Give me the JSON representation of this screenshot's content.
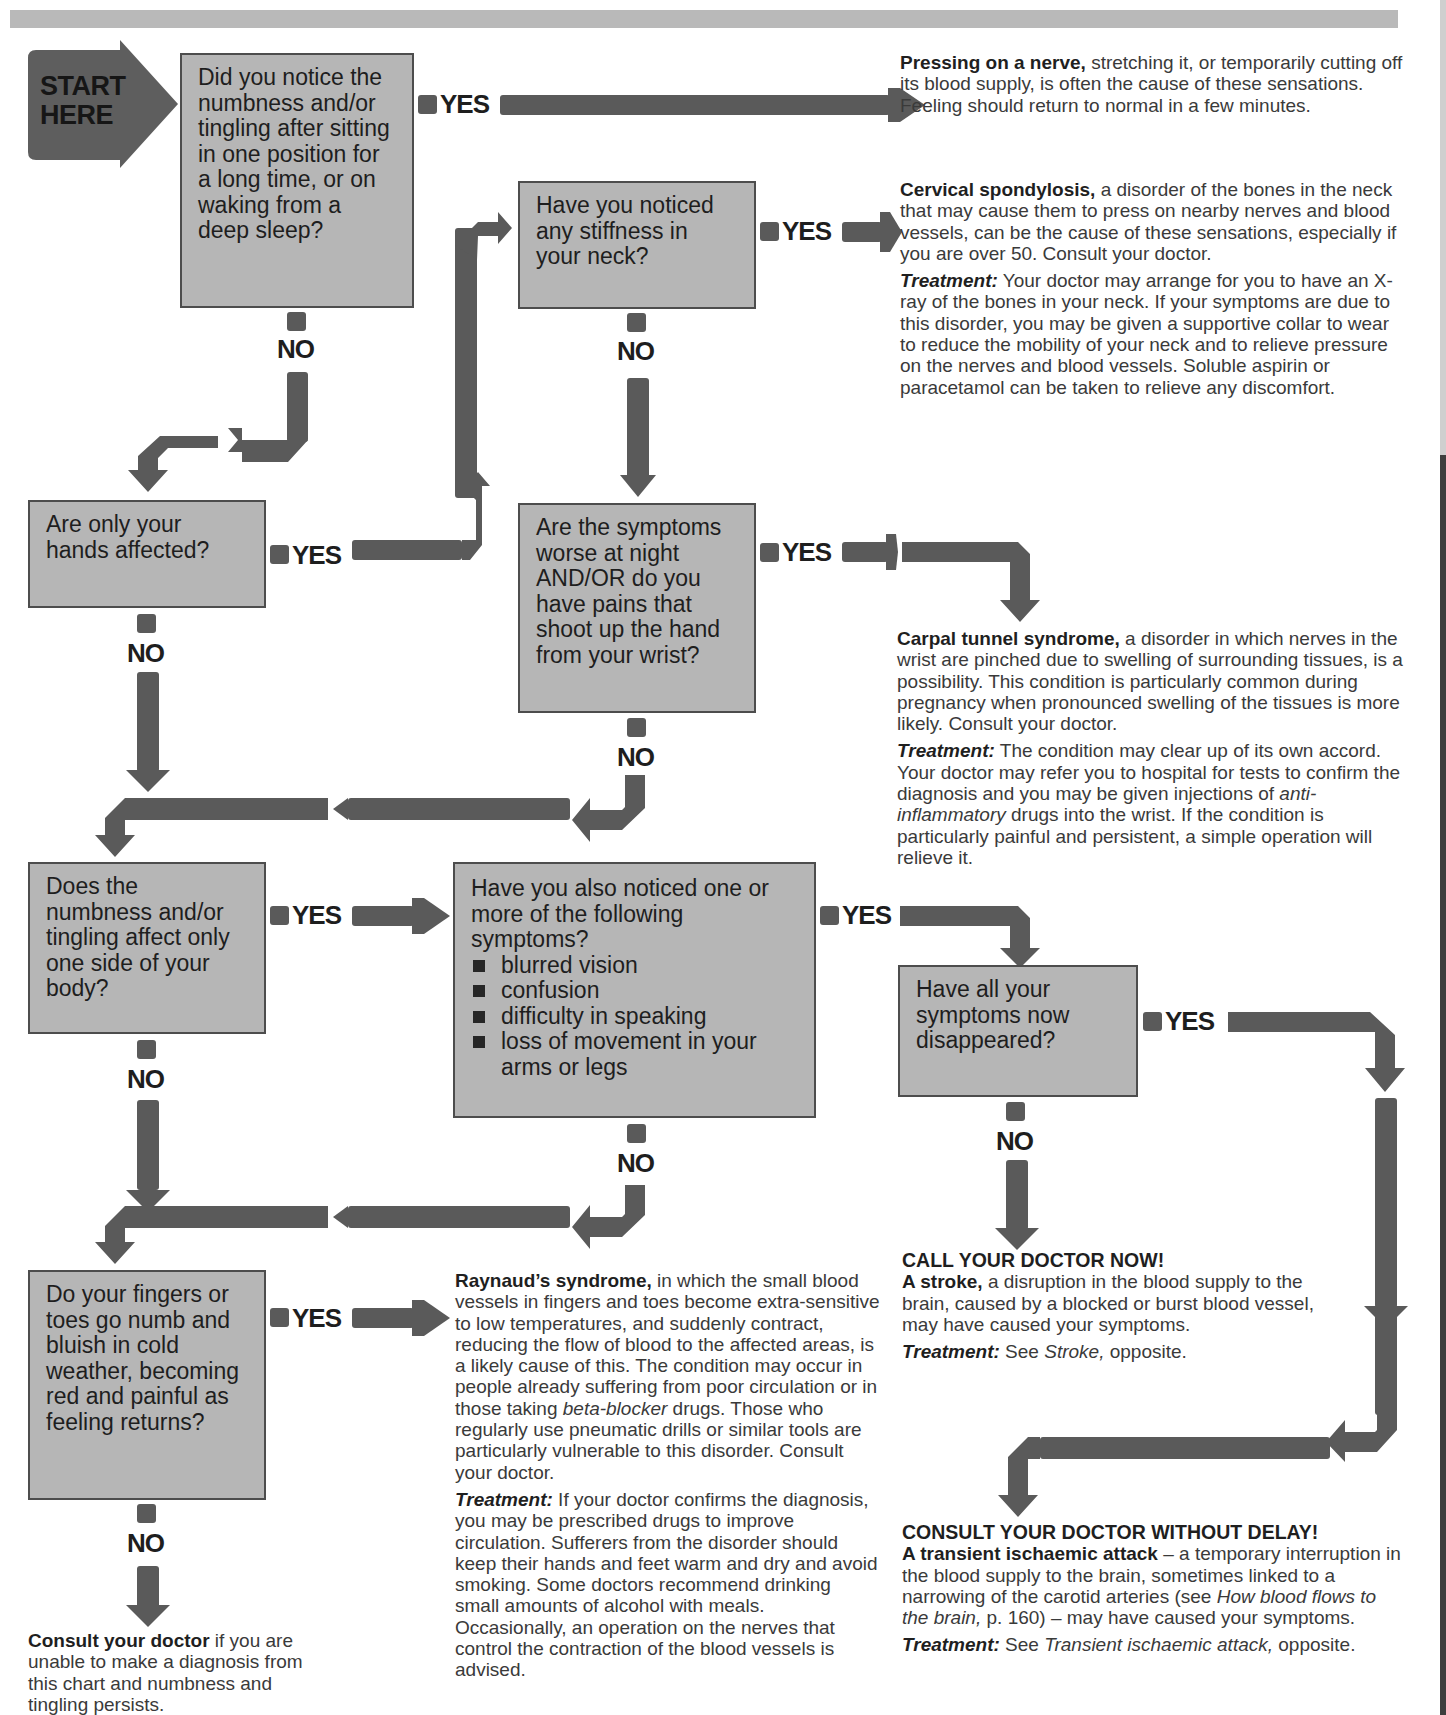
{
  "colors": {
    "box_fill": "#b6b6b6",
    "box_border": "#4d4d4d",
    "arrow": "#5a5a5a",
    "top_bar": "#b9b9b9"
  },
  "start": {
    "label_line1": "START",
    "label_line2": "HERE"
  },
  "labels": {
    "yes": "YES",
    "no": "NO"
  },
  "questions": [
    {
      "id": "q1",
      "text": "Did you notice the numbness and/or tingling after sitting in one position for a long time, or on waking from a deep sleep?"
    },
    {
      "id": "q2",
      "text": "Have you noticed any stiffness in your neck?"
    },
    {
      "id": "q3",
      "text": "Are only your hands affected?"
    },
    {
      "id": "q4",
      "text": "Are the symptoms worse at night AND/OR do you have pains that shoot up the hand from your wrist?"
    },
    {
      "id": "q5",
      "text": "Does the numbness and/or tingling affect only one side of your body?"
    },
    {
      "id": "q6",
      "text": "Have you also noticed one or more of the following symptoms?",
      "items": [
        "blurred vision",
        "confusion",
        "difficulty in speaking",
        "loss of movement in your arms or legs"
      ]
    },
    {
      "id": "q7",
      "text": "Have all your symptoms now disappeared?"
    },
    {
      "id": "q8",
      "text": "Do your fingers or toes go numb and bluish in cold weather, becoming red and painful as feeling returns?"
    }
  ],
  "results": {
    "pressing_nerve": {
      "title": "Pressing on a nerve,",
      "body": " stretching it, or temporarily cutting off its blood supply, is often the cause of these sensations. Feeling should return to normal in a few minutes."
    },
    "cervical": {
      "title": "Cervical spondylosis,",
      "body": " a disorder of the bones in the neck that may cause them to press on nearby nerves and blood vessels, can be the cause of these sensations, especially if you are over 50. Consult your doctor.",
      "treatment_label": "Treatment:",
      "treatment": " Your doctor may arrange for you to have an X-ray of the bones in your neck. If your symptoms are due to this disorder, you may be given a supportive collar to wear to reduce the mobility of your neck and to relieve pressure on the nerves and blood vessels. Soluble aspirin or paracetamol can be taken to relieve any discomfort."
    },
    "carpal": {
      "title": "Carpal tunnel syndrome,",
      "body": " a disorder in which nerves in the wrist are pinched due to swelling of surrounding tissues, is a possibility. This condition is particularly common during pregnancy when pronounced swelling of the tissues is more likely. Consult your doctor.",
      "treatment_label": "Treatment:",
      "treatment_a": " The condition may clear up of its own accord. Your doctor may refer you to hospital for tests to confirm the diagnosis and you may be given injections of ",
      "treatment_italic": "anti-inflammatory",
      "treatment_b": " drugs into the wrist. If the condition is particularly painful and persistent, a simple operation will relieve it."
    },
    "stroke": {
      "heading": "CALL YOUR DOCTOR NOW!",
      "title": "A stroke,",
      "body": " a disruption in the blood supply to the brain, caused by a blocked or burst blood vessel, may have caused your symptoms.",
      "treatment_label": "Treatment:",
      "treatment_a": " See ",
      "treatment_italic": "Stroke,",
      "treatment_b": " opposite."
    },
    "raynaud": {
      "title": "Raynaud’s syndrome,",
      "body_a": " in which the small blood vessels in fingers and toes become extra-sensitive to low temperatures, and suddenly contract, reducing the flow of blood to the affected areas, is a likely cause of this. The condition may occur in people already suffering from poor circulation or in those taking ",
      "body_italic": "beta-blocker",
      "body_b": " drugs. Those who regularly use pneumatic drills or similar tools are particularly vulnerable to this disorder. Consult your doctor.",
      "treatment_label": "Treatment:",
      "treatment": " If your doctor confirms the diagnosis, you may be prescribed drugs to improve circulation. Sufferers from the disorder should keep their hands and feet warm and dry and avoid smoking. Some doctors recommend drinking small amounts of alcohol with meals. Occasionally, an operation on the nerves that control the contraction of the blood vessels is advised."
    },
    "tia": {
      "heading": "CONSULT YOUR DOCTOR WITHOUT DELAY!",
      "title": "A transient ischaemic attack",
      "body_a": " – a temporary interruption in the blood supply to the brain, sometimes linked to a narrowing of the carotid arteries (see ",
      "body_italic": "How blood flows to the brain,",
      "body_b": " p. 160) – may have caused your symptoms.",
      "treatment_label": "Treatment:",
      "treatment_a": " See ",
      "treatment_italic": "Transient ischaemic attack,",
      "treatment_b": " opposite."
    },
    "consult": {
      "title": "Consult your doctor",
      "body": " if you are unable to make a diagnosis from this chart and numbness and tingling persists."
    }
  }
}
